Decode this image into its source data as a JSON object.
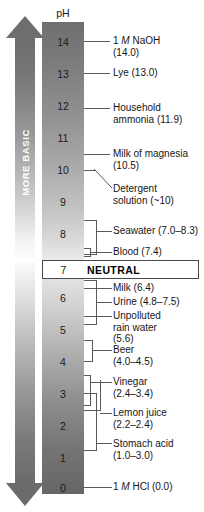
{
  "diagram": {
    "header_label": "pH",
    "neutral_label": "NEUTRAL",
    "neutral_ph": "7",
    "rails": [
      {
        "name": "more-basic",
        "label": "MORE BASIC",
        "direction": "up"
      },
      {
        "name": "more-acidic",
        "label": "MORE ACIDIC",
        "direction": "down"
      }
    ],
    "axis": {
      "min": 0,
      "max": 14,
      "ticks": [
        "14",
        "13",
        "12",
        "11",
        "10",
        "9",
        "8",
        "7",
        "6",
        "5",
        "4",
        "3",
        "2",
        "1",
        "0"
      ]
    },
    "colors": {
      "basic_dark": "#6e6e6e",
      "acidic_dark": "#6b6b6b",
      "mid_light": "#ebebeb",
      "line": "#5a5a5a",
      "text": "#161616"
    }
  },
  "ticks": [
    {
      "value": "14"
    },
    {
      "value": "13"
    },
    {
      "value": "12"
    },
    {
      "value": "11"
    },
    {
      "value": "10"
    },
    {
      "value": "9"
    },
    {
      "value": "8"
    },
    {
      "value": "7"
    },
    {
      "value": "6"
    },
    {
      "value": "5"
    },
    {
      "value": "4"
    },
    {
      "value": "3"
    },
    {
      "value": "2"
    },
    {
      "value": "1"
    },
    {
      "value": "0"
    }
  ],
  "callouts": [
    {
      "name": "naoh",
      "line1": "1 ",
      "em": "M",
      "line1b": " NaOH",
      "line2": "(14.0)",
      "ph": 14.0
    },
    {
      "name": "lye",
      "line1": "Lye (13.0)",
      "em": "",
      "line1b": "",
      "line2": "",
      "ph": 13.0
    },
    {
      "name": "ammonia",
      "line1": "Household",
      "em": "",
      "line1b": "",
      "line2": "ammonia (11.9)",
      "ph": 11.9
    },
    {
      "name": "magnesia",
      "line1": "Milk of magnesia",
      "em": "",
      "line1b": "",
      "line2": "(10.5)",
      "ph": 10.5
    },
    {
      "name": "detergent",
      "line1": "Detergent",
      "em": "",
      "line1b": "",
      "line2": "solution (~10)",
      "ph": 10.0
    },
    {
      "name": "seawater",
      "line1": "Seawater (7.0–8.3)",
      "em": "",
      "line1b": "",
      "line2": "",
      "ph_low": 7.0,
      "ph_high": 8.3
    },
    {
      "name": "blood",
      "line1": "Blood (7.4)",
      "em": "",
      "line1b": "",
      "line2": "",
      "ph": 7.4
    },
    {
      "name": "milk",
      "line1": "Milk (6.4)",
      "em": "",
      "line1b": "",
      "line2": "",
      "ph": 6.4
    },
    {
      "name": "urine",
      "line1": "Urine (4.8–7.5)",
      "em": "",
      "line1b": "",
      "line2": "",
      "ph_low": 4.8,
      "ph_high": 7.5
    },
    {
      "name": "rain",
      "line1": "Unpolluted",
      "em": "",
      "line1b": "",
      "line2": "rain water",
      "line3": "(5.6)",
      "ph": 5.6
    },
    {
      "name": "beer",
      "line1": "Beer",
      "em": "",
      "line1b": "",
      "line2": "(4.0–4.5)",
      "ph_low": 4.0,
      "ph_high": 4.5
    },
    {
      "name": "vinegar",
      "line1": "Vinegar",
      "em": "",
      "line1b": "",
      "line2": "(2.4–3.4)",
      "ph_low": 2.4,
      "ph_high": 3.4
    },
    {
      "name": "lemon",
      "line1": "Lemon juice",
      "em": "",
      "line1b": "",
      "line2": "(2.2–2.4)",
      "ph_low": 2.2,
      "ph_high": 2.4
    },
    {
      "name": "stomach",
      "line1": "Stomach acid",
      "em": "",
      "line1b": "",
      "line2": "(1.0–3.0)",
      "ph_low": 1.0,
      "ph_high": 3.0
    },
    {
      "name": "hcl",
      "line1": "1 ",
      "em": "M",
      "line1b": " HCl (0.0)",
      "line2": "",
      "ph": 0.0
    }
  ]
}
